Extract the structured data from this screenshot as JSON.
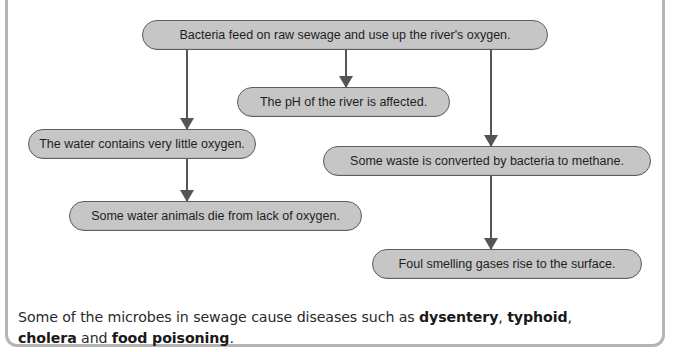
{
  "diagram": {
    "type": "flowchart",
    "colors": {
      "box_fill": "#c6c6c6",
      "box_border": "#5e5e5e",
      "arrow": "#555555",
      "frame": "#b4b4b4"
    },
    "nodes": [
      {
        "id": "n1",
        "text": "Bacteria feed on raw sewage and use up the river's oxygen."
      },
      {
        "id": "n2",
        "text": "The pH of the river is affected."
      },
      {
        "id": "n3",
        "text": "The water contains very little oxygen."
      },
      {
        "id": "n4",
        "text": "Some waste is converted by bacteria to methane."
      },
      {
        "id": "n5",
        "text": "Some water animals die from lack of oxygen."
      },
      {
        "id": "n6",
        "text": "Foul smelling gases rise to the surface."
      }
    ],
    "edges": [
      {
        "from": "n1",
        "to": "n3"
      },
      {
        "from": "n1",
        "to": "n2"
      },
      {
        "from": "n1",
        "to": "n4"
      },
      {
        "from": "n3",
        "to": "n5"
      },
      {
        "from": "n4",
        "to": "n6"
      }
    ]
  },
  "caption": {
    "part1": "Some of the microbes in sewage cause diseases such as ",
    "term1": "dysentery",
    "sep1": ", ",
    "term2": "typhoid",
    "sep2": ",",
    "part2": " and ",
    "term3": "cholera",
    "term4": "food poisoning",
    "end": "."
  }
}
